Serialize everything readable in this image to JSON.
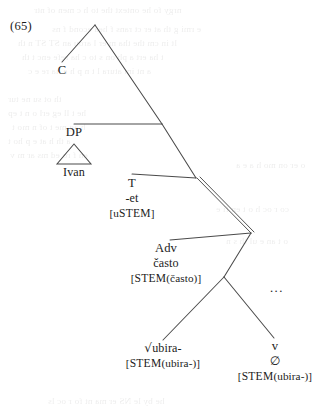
{
  "figure": {
    "example_number": "(65)",
    "type": "syntax-tree",
    "ink_color": "#4a4a4a",
    "text_color": "#1c1c1c",
    "background_color": "#ffffff"
  },
  "nodes": {
    "c": {
      "label": "C"
    },
    "dp": {
      "label": "DP",
      "terminal": "Ivan"
    },
    "t": {
      "label": "T",
      "form": "-et",
      "feature_open": "[",
      "feature_prefix": "u",
      "feature_sc": "STEM",
      "feature_close": "]"
    },
    "adv": {
      "label": "Adv",
      "form": "často",
      "feature_open": "[",
      "feature_sc": "STEM",
      "feature_arg": "(často)",
      "feature_close": "]"
    },
    "root": {
      "sign": "√",
      "label": "ubira-",
      "feature_open": "[",
      "feature_sc": "STEM",
      "feature_arg": "(ubira-)",
      "feature_close": "]"
    },
    "v": {
      "label": "v",
      "form": "∅",
      "feature_open": "[",
      "feature_sc": "STEM",
      "feature_arg": "(ubira-)",
      "feature_close": "]"
    },
    "ellipsis": {
      "label": "..."
    }
  },
  "bleed_text": [
    {
      "text": "nrgy fo he ontext the to h c men of ntr",
      "x": 34,
      "y": 5
    },
    {
      "text": "e rmi g th at er ct rans f  hea econd f ns",
      "x": 52,
      "y": 24
    },
    {
      "text": "lt in cm  the tha m er l arou  an ST ST n th",
      "x": 18,
      "y": 38
    },
    {
      "text": "t ha  ert a ph on s to c ha  refe enc  t  th",
      "x": 22,
      "y": 52
    },
    {
      "text": "a nt im atura l t  n  p h e ha  re e c",
      "x": 28,
      "y": 66
    },
    {
      "text": "th ot su ne tur",
      "x": 8,
      "y": 94
    },
    {
      "text": "he t ll  eg erl o  n t ep",
      "x": 8,
      "y": 108
    },
    {
      "text": "h  ag  me t of  n mo t",
      "x": 12,
      "y": 122
    },
    {
      "text": "a th  h at   e  p   ho t",
      "x": 8,
      "y": 136
    },
    {
      "text": "en  f ro ed  ms ar m v",
      "x": 10,
      "y": 150
    },
    {
      "text": "o  er  on mo h  a e a",
      "x": 236,
      "y": 160
    },
    {
      "text": "co  r oc  h o t en  fi  e",
      "x": 216,
      "y": 204
    },
    {
      "text": "o   t  an  e ul  th s   n",
      "x": 226,
      "y": 236
    },
    {
      "text": "he  by  le  NS  er  ma nt fo r oc ls",
      "x": 48,
      "y": 396
    }
  ]
}
